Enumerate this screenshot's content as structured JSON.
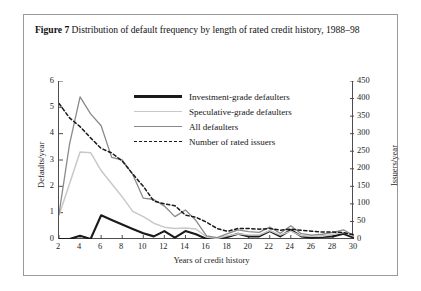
{
  "caption": {
    "label": "Figure 7",
    "text": "Distribution of default frequency by length of rated credit history, 1988–98"
  },
  "colors": {
    "investment_grade": "#1a1a1a",
    "speculative_grade": "#c8c8c8",
    "all_defaulters": "#8a8a8a",
    "rated_issuers": "#1a1a1a",
    "axis": "#4d4d4d",
    "frame": "#9a9a9a"
  },
  "chart_data": {
    "type": "line",
    "title": "Distribution of default frequency by length of rated credit history, 1988–98",
    "xlabel": "Years of credit history",
    "ylabel": "Defaults/year",
    "y2label": "Issuers/year",
    "xlim": [
      2,
      30
    ],
    "ylim": [
      0,
      6
    ],
    "y2lim": [
      0,
      450
    ],
    "grid": false,
    "legend_position": "upper-right-inside",
    "xticks": [
      2,
      4,
      6,
      8,
      10,
      12,
      14,
      16,
      18,
      20,
      22,
      24,
      26,
      28,
      30
    ],
    "yticks": [
      0,
      1,
      2,
      3,
      4,
      5,
      6
    ],
    "y2ticks": [
      0,
      50,
      100,
      150,
      200,
      250,
      300,
      350,
      400,
      450
    ],
    "x": [
      2,
      3,
      4,
      5,
      6,
      7,
      8,
      9,
      10,
      11,
      12,
      13,
      14,
      15,
      16,
      17,
      18,
      19,
      20,
      21,
      22,
      23,
      24,
      25,
      26,
      27,
      28,
      29,
      30
    ],
    "series": [
      {
        "name": "Investment-grade defaulters",
        "axis": "left",
        "color": "#1a1a1a",
        "style": "solid",
        "width": 2.1,
        "values": [
          0.0,
          0.0,
          0.12,
          0.0,
          0.9,
          0.72,
          0.55,
          0.38,
          0.22,
          0.1,
          0.3,
          0.05,
          0.3,
          0.18,
          0.0,
          0.0,
          0.08,
          0.2,
          0.1,
          0.1,
          0.3,
          0.1,
          0.35,
          0.1,
          0.05,
          0.08,
          0.1,
          0.2,
          0.05
        ]
      },
      {
        "name": "Speculative-grade defaulters",
        "axis": "left",
        "color": "#c8c8c8",
        "style": "solid",
        "width": 1.5,
        "values": [
          0.9,
          2.1,
          3.3,
          3.28,
          2.6,
          2.1,
          1.6,
          1.05,
          0.85,
          0.6,
          0.45,
          0.4,
          0.42,
          0.38,
          0.08,
          0.02,
          0.12,
          0.2,
          0.15,
          0.15,
          0.32,
          0.15,
          0.3,
          0.12,
          0.1,
          0.1,
          0.18,
          0.25,
          0.1
        ]
      },
      {
        "name": "All defaulters",
        "axis": "left",
        "color": "#8a8a8a",
        "style": "solid",
        "width": 1.3,
        "values": [
          0.95,
          3.6,
          5.4,
          4.75,
          4.3,
          3.1,
          3.0,
          2.45,
          1.55,
          1.5,
          1.25,
          0.85,
          1.1,
          0.7,
          0.12,
          0.05,
          0.2,
          0.35,
          0.28,
          0.25,
          0.45,
          0.22,
          0.5,
          0.2,
          0.15,
          0.18,
          0.25,
          0.35,
          0.12
        ]
      },
      {
        "name": "Number of rated issuers",
        "axis": "right",
        "color": "#1a1a1a",
        "style": "dashed",
        "width": 1.5,
        "values": [
          386,
          345,
          320,
          288,
          258,
          245,
          222,
          185,
          150,
          108,
          100,
          95,
          68,
          62,
          48,
          30,
          22,
          30,
          30,
          28,
          30,
          25,
          28,
          25,
          22,
          20,
          20,
          18,
          12
        ]
      }
    ]
  },
  "legend": {
    "items": [
      {
        "label": "Investment-grade defaulters",
        "swatch": "thick-solid-dark"
      },
      {
        "label": "Speculative-grade defaulters",
        "swatch": "thin-solid-light"
      },
      {
        "label": "All defaulters",
        "swatch": "thin-solid-gray"
      },
      {
        "label": "Number of rated issuers",
        "swatch": "dashed-dark"
      }
    ]
  },
  "axes": {
    "left": {
      "title": "Defaults/year",
      "ticks": [
        "0",
        "1",
        "2",
        "3",
        "4",
        "5",
        "6"
      ]
    },
    "right": {
      "title": "Issuers/year",
      "ticks": [
        "0",
        "50",
        "100",
        "150",
        "200",
        "250",
        "300",
        "350",
        "400",
        "450"
      ]
    },
    "bottom": {
      "title": "Years of credit history",
      "ticks": [
        "2",
        "4",
        "6",
        "8",
        "10",
        "12",
        "14",
        "16",
        "18",
        "20",
        "22",
        "24",
        "26",
        "28",
        "30"
      ]
    }
  }
}
